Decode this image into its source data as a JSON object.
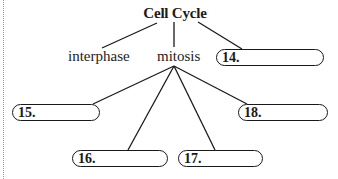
{
  "diagram": {
    "title": "Cell Cycle",
    "children": [
      {
        "label": "interphase",
        "type": "text"
      },
      {
        "label": "mitosis",
        "type": "text"
      },
      {
        "label": "14.",
        "type": "blank"
      }
    ],
    "mitosis_children": [
      {
        "label": "15.",
        "type": "blank"
      },
      {
        "label": "16.",
        "type": "blank"
      },
      {
        "label": "17.",
        "type": "blank"
      },
      {
        "label": "18.",
        "type": "blank"
      }
    ],
    "line_color": "#1a1a1a"
  }
}
